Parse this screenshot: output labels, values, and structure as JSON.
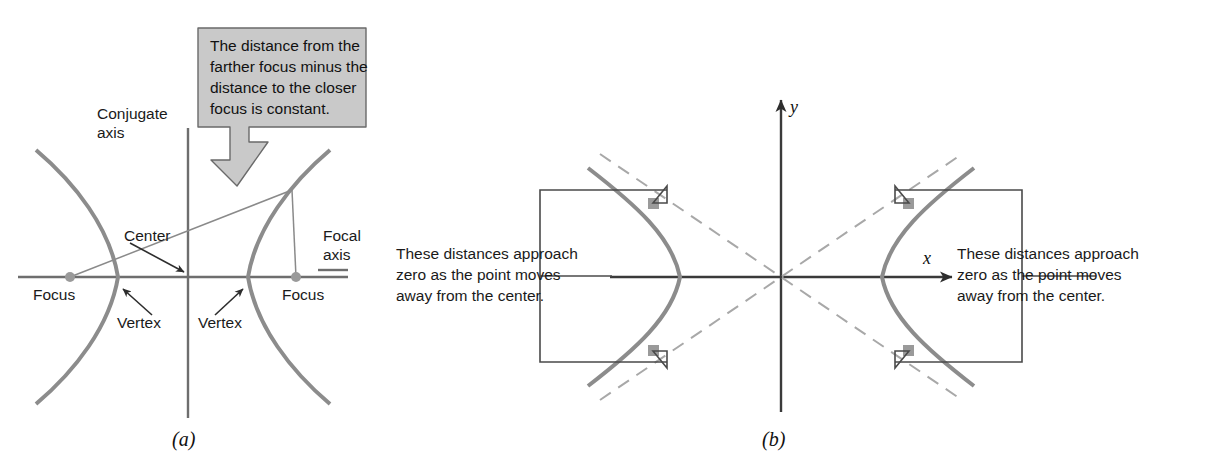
{
  "figure": {
    "panel_a": {
      "caption": "(a)",
      "labels": {
        "conjugate_axis_line1": "Conjugate",
        "conjugate_axis_line2": "axis",
        "center": "Center",
        "focal_axis_line1": "Focal",
        "focal_axis_line2": "axis",
        "focus_left": "Focus",
        "focus_right": "Focus",
        "vertex_left": "Vertex",
        "vertex_right": "Vertex"
      },
      "callout": {
        "line1": "The distance from the",
        "line2": "farther focus minus the",
        "line3": "distance to the closer",
        "line4": "focus is constant.",
        "fill_color": "#c9c9c9",
        "border_color": "#5a5a5a"
      }
    },
    "panel_b": {
      "caption": "(b)",
      "axis_x": "x",
      "axis_y": "y",
      "note_left": {
        "line1": "These distances approach",
        "line2": "zero as the point moves",
        "line3": "away from the center."
      },
      "note_right": {
        "line1": "These distances approach",
        "line2": "zero as the point moves",
        "line3": "away from the center."
      }
    },
    "colors": {
      "curve": "#8c8c8c",
      "axis": "#6e6e6e",
      "leader": "#4a4a4a",
      "point": "#9a9a9a",
      "asymptote": "#a8a8a8",
      "background": "#ffffff"
    }
  }
}
